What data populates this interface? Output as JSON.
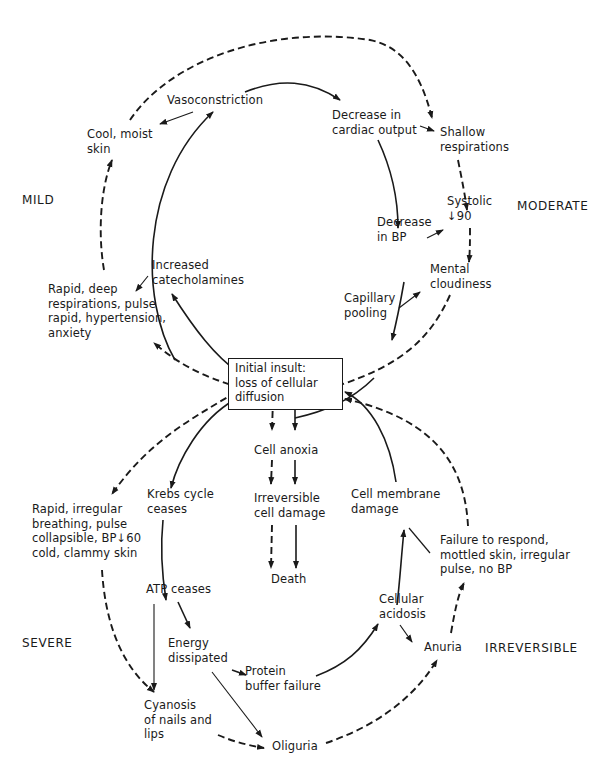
{
  "stages": {
    "mild": "MILD",
    "moderate": "MODERATE",
    "severe": "SEVERE",
    "irreversible": "IRREVERSIBLE"
  },
  "center": "Initial insult:\nloss of cellular\ndiffusion",
  "nodes": {
    "vasoconstriction": "Vasoconstriction",
    "decrease_cardiac_output": "Decrease in\ncardiac output",
    "cool_moist_skin": "Cool, moist\nskin",
    "shallow_respirations": "Shallow\nrespirations",
    "systolic_90": "Systolic\n↓90",
    "decrease_bp": "Decrease\nin BP",
    "increased_catecholamines": "Increased\ncatecholamines",
    "mental_cloudiness": "Mental\ncloudiness",
    "rapid_deep": "Rapid, deep\nrespirations, pulse\nrapid, hypertension,\nanxiety",
    "capillary_pooling": "Capillary\npooling",
    "cell_anoxia": "Cell anoxia",
    "krebs": "Krebs cycle\nceases",
    "irreversible_damage": "Irreversible\ncell damage",
    "cell_membrane": "Cell membrane\ndamage",
    "rapid_irregular": "Rapid, irregular\nbreathing, pulse\ncollapsible, BP↓60\ncold, clammy skin",
    "failure_respond": "Failure to respond,\nmottled skin, irregular\npulse, no BP",
    "death": "Death",
    "atp": "ATP ceases",
    "cellular_acidosis": "Cellular\nacidosis",
    "energy": "Energy\ndissipated",
    "anuria": "Anuria",
    "protein": "Protein\nbuffer failure",
    "cyanosis": "Cyanosis\nof nails and\nlips",
    "oliguria": "Oliguria"
  },
  "colors": {
    "ink": "#1a1a1a",
    "background": "#ffffff"
  }
}
